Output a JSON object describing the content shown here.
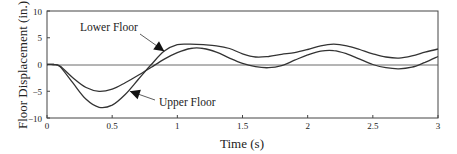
{
  "chart_data": {
    "type": "line",
    "title": "",
    "xlabel": "Time (s)",
    "ylabel": "Floor Displacement (in.)",
    "xlim": [
      0,
      3
    ],
    "ylim": [
      -10,
      10
    ],
    "xticks": [
      "0",
      "0.5",
      "1",
      "1.5",
      "2",
      "2.5",
      "3"
    ],
    "yticks": [
      "10",
      "5",
      "0",
      "-5",
      "-10"
    ],
    "grid": false,
    "legend": "annotations with arrows",
    "x": [
      0,
      0.05,
      0.1,
      0.2,
      0.3,
      0.4,
      0.5,
      0.6,
      0.7,
      0.8,
      0.9,
      1.0,
      1.1,
      1.2,
      1.3,
      1.4,
      1.5,
      1.6,
      1.7,
      1.8,
      1.9,
      2.0,
      2.1,
      2.2,
      2.3,
      2.4,
      2.5,
      2.6,
      2.7,
      2.8,
      2.9,
      3.0
    ],
    "series": [
      {
        "name": "Lower Floor",
        "values": [
          0,
          0,
          -0.3,
          -2.5,
          -4.3,
          -5.0,
          -4.6,
          -3.4,
          -2.0,
          -0.5,
          1.0,
          2.2,
          3.0,
          3.0,
          2.3,
          1.2,
          0.2,
          -0.4,
          -0.6,
          -0.2,
          0.8,
          1.8,
          2.5,
          2.6,
          2.0,
          1.0,
          0.0,
          -0.6,
          -0.8,
          -0.5,
          0.4,
          1.5
        ]
      },
      {
        "name": "Upper Floor",
        "values": [
          0,
          0,
          -0.4,
          -3.5,
          -6.5,
          -8.0,
          -7.6,
          -5.6,
          -2.8,
          0.0,
          2.5,
          3.7,
          3.8,
          3.7,
          3.5,
          3.0,
          2.0,
          1.4,
          1.5,
          1.9,
          2.2,
          2.8,
          3.5,
          3.8,
          3.5,
          2.8,
          2.0,
          1.4,
          1.2,
          1.6,
          2.3,
          2.9
        ]
      }
    ],
    "annotations": [
      {
        "text": "Lower Floor",
        "arrow_to": [
          0.9,
          2.5
        ]
      },
      {
        "text": "Upper Floor",
        "arrow_to": [
          0.62,
          -4.8
        ]
      }
    ]
  }
}
